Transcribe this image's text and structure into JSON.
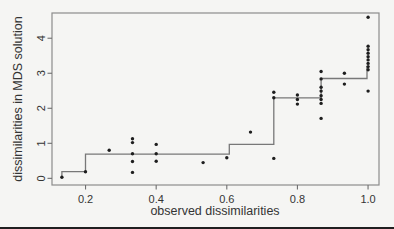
{
  "figure": {
    "background": "#f5f5f3",
    "bottom_rule_color": "#1f1f1f"
  },
  "chart_data": {
    "type": "scatter",
    "title": "",
    "xlabel": "observed dissimilarities",
    "ylabel": "dissimilarities in MDS solution",
    "xlim": [
      0.105,
      1.031
    ],
    "ylim": [
      -0.19,
      4.72
    ],
    "x_ticks": [
      0.2,
      0.4,
      0.6,
      0.8,
      1.0
    ],
    "x_tick_labels": [
      "0.2",
      "0.4",
      "0.6",
      "0.8",
      "1.0"
    ],
    "y_ticks": [
      0,
      1,
      2,
      3,
      4
    ],
    "y_tick_labels": [
      "0",
      "1",
      "2",
      "3",
      "4"
    ],
    "grid": false,
    "legend": null,
    "point_color": "#1e1e1e",
    "line_color": "#787878",
    "box_color": "#8c8c8c",
    "tick_color": "#6f6f6f",
    "points": [
      [
        0.133,
        0.03
      ],
      [
        0.2,
        0.19
      ],
      [
        0.267,
        0.8
      ],
      [
        0.333,
        1.13
      ],
      [
        0.333,
        1.02
      ],
      [
        0.333,
        0.7
      ],
      [
        0.333,
        0.48
      ],
      [
        0.333,
        0.17
      ],
      [
        0.4,
        0.97
      ],
      [
        0.4,
        0.7
      ],
      [
        0.4,
        0.49
      ],
      [
        0.533,
        0.45
      ],
      [
        0.6,
        0.59
      ],
      [
        0.667,
        1.32
      ],
      [
        0.733,
        2.46
      ],
      [
        0.733,
        2.3
      ],
      [
        0.733,
        0.57
      ],
      [
        0.8,
        2.38
      ],
      [
        0.8,
        2.25
      ],
      [
        0.8,
        2.12
      ],
      [
        0.867,
        3.05
      ],
      [
        0.867,
        2.84
      ],
      [
        0.867,
        2.6
      ],
      [
        0.867,
        2.49
      ],
      [
        0.867,
        2.36
      ],
      [
        0.867,
        2.25
      ],
      [
        0.867,
        2.14
      ],
      [
        0.867,
        1.71
      ],
      [
        0.933,
        3.0
      ],
      [
        0.933,
        2.69
      ],
      [
        1.0,
        4.6
      ],
      [
        1.0,
        3.77
      ],
      [
        1.0,
        3.67
      ],
      [
        1.0,
        3.57
      ],
      [
        1.0,
        3.47
      ],
      [
        1.0,
        3.38
      ],
      [
        1.0,
        3.28
      ],
      [
        1.0,
        3.19
      ],
      [
        1.0,
        3.1
      ],
      [
        1.0,
        2.49
      ]
    ],
    "step_line": [
      [
        0.133,
        0.06
      ],
      [
        0.133,
        0.19
      ],
      [
        0.2,
        0.19
      ],
      [
        0.2,
        0.69
      ],
      [
        0.607,
        0.69
      ],
      [
        0.607,
        0.97
      ],
      [
        0.733,
        0.97
      ],
      [
        0.733,
        2.3
      ],
      [
        0.867,
        2.3
      ],
      [
        0.867,
        2.85
      ],
      [
        0.997,
        2.85
      ],
      [
        0.997,
        3.2
      ]
    ]
  }
}
